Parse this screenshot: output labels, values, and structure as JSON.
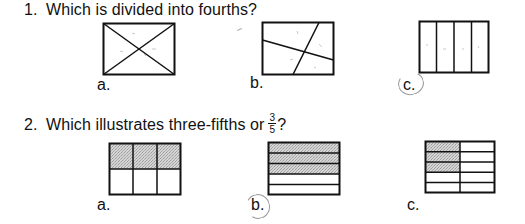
{
  "questions": [
    {
      "number": "1.",
      "text": "Which is divided into fourths?",
      "options": [
        {
          "label": "a.",
          "figure": "rectangle-divided-by-diagonals",
          "parts": 4,
          "equal_parts": false,
          "selected": false
        },
        {
          "label": "b.",
          "figure": "rectangle-divided-by-two-skewed-lines",
          "parts": 4,
          "equal_parts": false,
          "selected": false
        },
        {
          "label": "c.",
          "figure": "rectangle-four-vertical-strips",
          "parts": 4,
          "equal_parts": true,
          "selected": true
        }
      ]
    },
    {
      "number": "2.",
      "text_before": "Which illustrates three-fifths or",
      "fraction": {
        "numerator": "3",
        "denominator": "5"
      },
      "text_after": "?",
      "options": [
        {
          "label": "a.",
          "figure": "2x3-grid-top-row-shaded",
          "shaded": 3,
          "total": 6,
          "selected": false
        },
        {
          "label": "b.",
          "figure": "5-horizontal-strips-top-3-shaded",
          "shaded": 3,
          "total": 5,
          "selected": true
        },
        {
          "label": "c.",
          "figure": "5x2-grid-left-column-top-3-shaded",
          "shaded": 3,
          "total": 10,
          "selected": false
        }
      ]
    }
  ],
  "colors": {
    "ink": "#111111",
    "shade": "#c8c8c8",
    "pencil_mark": "#9a9a9a"
  }
}
